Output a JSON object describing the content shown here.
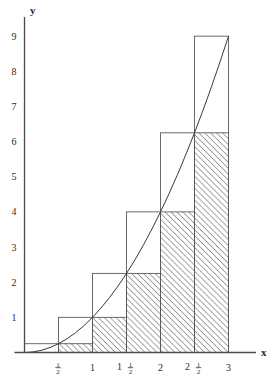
{
  "chart_data": {
    "type": "area",
    "title": "",
    "subtitle": "",
    "xlabel": "x",
    "ylabel": "y",
    "xlim": [
      0,
      3.25
    ],
    "ylim": [
      0,
      9.6
    ],
    "grid": false,
    "legend_position": "none",
    "function": "y = x^2",
    "curve": {
      "name": "y = x squared",
      "x": [
        0,
        0.125,
        0.25,
        0.375,
        0.5,
        0.625,
        0.75,
        0.875,
        1,
        1.125,
        1.25,
        1.375,
        1.5,
        1.625,
        1.75,
        1.875,
        2,
        2.125,
        2.25,
        2.375,
        2.5,
        2.625,
        2.75,
        2.875,
        3
      ],
      "y": [
        0,
        0.016,
        0.063,
        0.141,
        0.25,
        0.391,
        0.563,
        0.766,
        1,
        1.266,
        1.563,
        1.891,
        2.25,
        2.641,
        3.063,
        3.516,
        4,
        4.516,
        5.063,
        5.641,
        6.25,
        6.891,
        7.563,
        8.266,
        9
      ]
    },
    "interval_width": 0.5,
    "upper_sum_bars": {
      "name": "Upper Riemann sum (circumscribed rectangles)",
      "fill": "none",
      "x_left": [
        0,
        0.5,
        1,
        1.5,
        2,
        2.5
      ],
      "x_right": [
        0.5,
        1,
        1.5,
        2,
        2.5,
        3
      ],
      "values": [
        0.25,
        1,
        2.25,
        4,
        6.25,
        9
      ]
    },
    "lower_sum_bars": {
      "name": "Lower Riemann sum (inscribed rectangles, hatched)",
      "fill": "diagonal-hatch",
      "x_left": [
        0,
        0.5,
        1,
        1.5,
        2,
        2.5
      ],
      "x_right": [
        0.5,
        1,
        1.5,
        2,
        2.5,
        3
      ],
      "values": [
        0,
        0.25,
        1,
        2.25,
        4,
        6.25
      ]
    },
    "x_ticks": [
      {
        "value": 0.5,
        "label": "½",
        "whole": "",
        "num": "1",
        "den": "2"
      },
      {
        "value": 1,
        "label": "1",
        "whole": "1",
        "num": "",
        "den": ""
      },
      {
        "value": 1.5,
        "label": "1½",
        "whole": "1",
        "num": "1",
        "den": "2"
      },
      {
        "value": 2,
        "label": "2",
        "whole": "2",
        "num": "",
        "den": ""
      },
      {
        "value": 2.5,
        "label": "2½",
        "whole": "2",
        "num": "1",
        "den": "2"
      },
      {
        "value": 3,
        "label": "3",
        "whole": "3",
        "num": "",
        "den": ""
      }
    ],
    "y_ticks": [
      {
        "value": 1,
        "label": "1"
      },
      {
        "value": 2,
        "label": "2"
      },
      {
        "value": 3,
        "label": "3"
      },
      {
        "value": 4,
        "label": "4"
      },
      {
        "value": 5,
        "label": "5"
      },
      {
        "value": 6,
        "label": "6"
      },
      {
        "value": 7,
        "label": "7"
      },
      {
        "value": 8,
        "label": "8"
      },
      {
        "value": 9,
        "label": "9"
      }
    ],
    "colors": {
      "axis": "#4a4a4a",
      "curve": "#3a3a3a",
      "bar_outline": "#5a5a5a",
      "hatch": "#3c3c3c",
      "background": "#ffffff",
      "text": "#2b2b2b"
    }
  },
  "axes": {
    "y_axis_label": "y",
    "x_axis_label": "x"
  }
}
